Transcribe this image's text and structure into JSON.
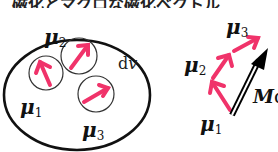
{
  "header": {
    "cut_text": "磁化とマクロな磁化ベクトル"
  },
  "left_panel": {
    "volume_label_d": "d",
    "volume_label_v": "v",
    "moments": [
      {
        "symbol": "μ",
        "index": "1"
      },
      {
        "symbol": "μ",
        "index": "2"
      },
      {
        "symbol": "μ",
        "index": "3"
      }
    ]
  },
  "right_panel": {
    "moments": [
      {
        "symbol": "μ",
        "index": "1"
      },
      {
        "symbol": "μ",
        "index": "2"
      },
      {
        "symbol": "μ",
        "index": "3"
      }
    ],
    "resultant_label_M": "M",
    "resultant_label_d": "d"
  },
  "colors": {
    "arrow": "#f0336a",
    "outline": "#111111",
    "resultant": "#000000"
  }
}
